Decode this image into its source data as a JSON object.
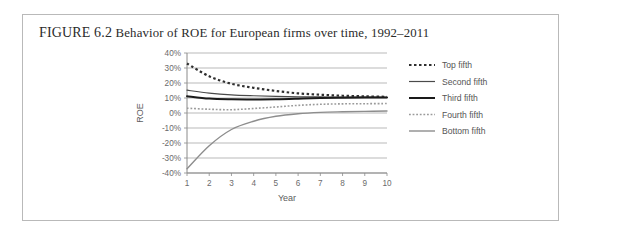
{
  "figure": {
    "label": "FIGURE 6.2",
    "caption": "Behavior of ROE for European firms over time, 1992–2011"
  },
  "chart_data": {
    "type": "line",
    "title": "Behavior of ROE for European firms over time, 1992–2011",
    "xlabel": "Year",
    "ylabel": "ROE",
    "xlim": [
      1,
      10
    ],
    "ylim": [
      -0.4,
      0.4
    ],
    "grid": true,
    "legend_position": "right",
    "x": [
      1,
      2,
      3,
      4,
      5,
      6,
      7,
      8,
      9,
      10
    ],
    "xtick_labels": [
      "1",
      "2",
      "3",
      "4",
      "5",
      "6",
      "7",
      "8",
      "9",
      "10"
    ],
    "ytick_labels": [
      "40%",
      "30%",
      "20%",
      "10%",
      "0%",
      "-10%",
      "-20%",
      "-30%",
      "-40%"
    ],
    "ytick_values": [
      0.4,
      0.3,
      0.2,
      0.1,
      0.0,
      -0.1,
      -0.2,
      -0.3,
      -0.4
    ],
    "series": [
      {
        "name": "Top fifth",
        "style": "dotted",
        "color": "#2f2f2f",
        "width": 2.2,
        "values": [
          0.33,
          0.245,
          0.195,
          0.168,
          0.147,
          0.131,
          0.122,
          0.115,
          0.111,
          0.108
        ]
      },
      {
        "name": "Second fifth",
        "style": "solid",
        "color": "#4a4a4a",
        "width": 1.2,
        "values": [
          0.152,
          0.133,
          0.121,
          0.115,
          0.111,
          0.108,
          0.107,
          0.106,
          0.106,
          0.105
        ]
      },
      {
        "name": "Third fifth",
        "style": "solid",
        "color": "#1a1a1a",
        "width": 2.0,
        "values": [
          0.112,
          0.096,
          0.091,
          0.09,
          0.091,
          0.095,
          0.1,
          0.102,
          0.103,
          0.103
        ]
      },
      {
        "name": "Fourth fifth",
        "style": "dotted",
        "color": "#9a9a9a",
        "width": 1.6,
        "values": [
          0.032,
          0.025,
          0.022,
          0.03,
          0.04,
          0.051,
          0.058,
          0.061,
          0.062,
          0.063
        ]
      },
      {
        "name": "Bottom fifth",
        "style": "solid",
        "color": "#8d8d8d",
        "width": 1.4,
        "values": [
          -0.372,
          -0.218,
          -0.11,
          -0.055,
          -0.022,
          -0.005,
          0.004,
          0.008,
          0.011,
          0.013
        ]
      }
    ]
  }
}
